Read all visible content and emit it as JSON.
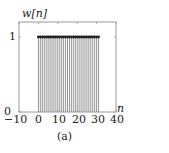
{
  "chart_data": {
    "type": "stem",
    "title": "",
    "ylabel": "w[n]",
    "xlabel": "n",
    "caption": "(a)",
    "xlim": [
      -10,
      40
    ],
    "ylim": [
      0,
      1.2
    ],
    "xticks": [
      -10,
      0,
      10,
      20,
      30,
      40
    ],
    "xtick_labels": [
      "−10",
      "0",
      "10",
      "20",
      "30",
      "40"
    ],
    "yticks": [
      0,
      1
    ],
    "ytick_labels": [
      "0",
      "1"
    ],
    "grid": false,
    "x": [
      0,
      1,
      2,
      3,
      4,
      5,
      6,
      7,
      8,
      9,
      10,
      11,
      12,
      13,
      14,
      15,
      16,
      17,
      18,
      19,
      20,
      21,
      22,
      23,
      24,
      25,
      26,
      27,
      28,
      29,
      30,
      31
    ],
    "values": [
      1,
      1,
      1,
      1,
      1,
      1,
      1,
      1,
      1,
      1,
      1,
      1,
      1,
      1,
      1,
      1,
      1,
      1,
      1,
      1,
      1,
      1,
      1,
      1,
      1,
      1,
      1,
      1,
      1,
      1,
      1,
      1
    ],
    "stem_color": "#8a8a8a",
    "marker_color": "#222222",
    "axis_color": "#9a9a9a"
  }
}
